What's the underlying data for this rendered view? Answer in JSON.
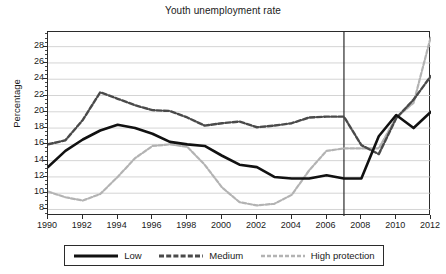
{
  "chart_data": {
    "type": "line",
    "title": "Youth unemployment rate",
    "xlabel": "",
    "ylabel": "Percentage",
    "xlim": [
      1990,
      2012
    ],
    "ylim": [
      7.2,
      29.8
    ],
    "yticks": [
      8,
      10,
      12,
      14,
      16,
      18,
      20,
      22,
      24,
      26,
      28
    ],
    "xticks": [
      1990,
      1992,
      1994,
      1996,
      1998,
      2000,
      2002,
      2004,
      2006,
      2008,
      2010,
      2012
    ],
    "grid": true,
    "legend_position": "bottom",
    "x": [
      1990,
      1991,
      1992,
      1993,
      1994,
      1995,
      1996,
      1997,
      1998,
      1999,
      2000,
      2001,
      2002,
      2003,
      2004,
      2005,
      2006,
      2007,
      2008,
      2009,
      2010,
      2011,
      2012
    ],
    "series": [
      {
        "name": "Low",
        "color": "#111111",
        "style": "solid",
        "values": [
          13.2,
          15.2,
          16.6,
          17.7,
          18.4,
          18.0,
          17.3,
          16.3,
          16.0,
          15.8,
          14.6,
          13.5,
          13.2,
          12.0,
          11.8,
          11.8,
          12.2,
          11.8,
          11.8,
          17.0,
          19.6,
          18.0,
          20.0
        ]
      },
      {
        "name": "Medium",
        "color": "#4a4a4a",
        "style": "dashed",
        "values": [
          16.0,
          16.5,
          19.0,
          22.4,
          21.6,
          20.8,
          20.2,
          20.1,
          19.3,
          18.3,
          18.6,
          18.8,
          18.1,
          18.3,
          18.6,
          19.3,
          19.4,
          19.4,
          15.9,
          14.8,
          19.2,
          21.5,
          24.4
        ]
      },
      {
        "name": "High protection",
        "color": "#b3b3b3",
        "style": "dashed",
        "values": [
          10.2,
          9.5,
          9.1,
          9.9,
          12.0,
          14.3,
          15.8,
          16.0,
          15.7,
          13.5,
          10.7,
          8.9,
          8.5,
          8.7,
          9.8,
          12.8,
          15.2,
          15.5,
          15.5,
          15.5,
          19.3,
          21.1,
          29.3
        ]
      }
    ],
    "annotations": [
      {
        "type": "vline",
        "x": 2007,
        "color": "#2b2b2b"
      }
    ]
  },
  "legend": {
    "items": [
      {
        "label": "Low",
        "icon": "solid-line-swatch"
      },
      {
        "label": "Medium",
        "icon": "dashed-line-swatch"
      },
      {
        "label": "High protection",
        "icon": "dotted-line-swatch"
      }
    ]
  }
}
